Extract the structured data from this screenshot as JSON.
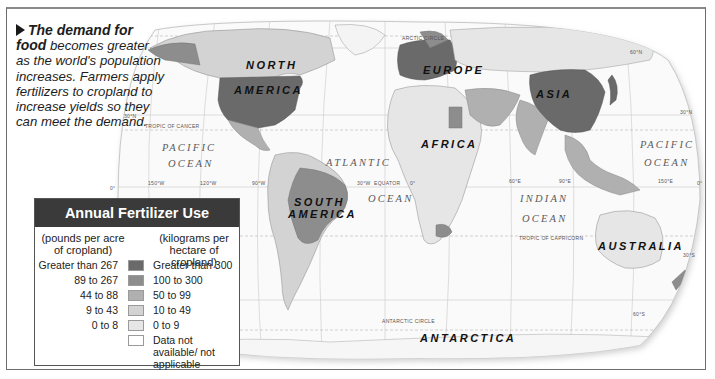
{
  "caption": {
    "lead": "The demand for food",
    "body": "becomes greater as the world's population increases. Farmers apply fertilizers to cropland to increase yields so they can meet the demand."
  },
  "legend": {
    "title": "Annual Fertilizer Use",
    "left_header": "(pounds per acre of cropland)",
    "right_header": "(kilograms per hectare of cropland)",
    "rows": [
      {
        "pounds": "Greater than 267",
        "kilograms": "Greater than 300",
        "color": "#6a6a6a"
      },
      {
        "pounds": "89 to 267",
        "kilograms": "100 to 300",
        "color": "#8d8d8d"
      },
      {
        "pounds": "44 to 88",
        "kilograms": "50 to 99",
        "color": "#b0b0b0"
      },
      {
        "pounds": "9 to 43",
        "kilograms": "10 to 49",
        "color": "#d3d3d3"
      },
      {
        "pounds": "0 to 8",
        "kilograms": "0 to 9",
        "color": "#e6e6e6"
      },
      {
        "pounds": "",
        "kilograms": "Data not available/ not applicable",
        "color": "#ffffff"
      }
    ]
  },
  "map": {
    "continents": {
      "north_america_1": "NORTH",
      "north_america_2": "AMERICA",
      "south_america_1": "SOUTH",
      "south_america_2": "AMERICA",
      "europe": "EUROPE",
      "asia": "ASIA",
      "africa": "AFRICA",
      "australia": "AUSTRALIA",
      "antarctica": "ANTARCTICA"
    },
    "oceans": {
      "pacific_w_1": "PACIFIC",
      "pacific_w_2": "OCEAN",
      "atlantic_1": "ATLANTIC",
      "atlantic_2": "OCEAN",
      "indian_1": "INDIAN",
      "indian_2": "OCEAN",
      "pacific_e_1": "PACIFIC",
      "pacific_e_2": "OCEAN"
    },
    "lines": {
      "arctic_circle": "ARCTIC CIRCLE",
      "tropic_cancer": "TROPIC OF CANCER",
      "equator": "EQUATOR",
      "tropic_capricorn": "TROPIC OF CAPRICORN",
      "antarctic_circle": "ANTARCTIC CIRCLE"
    },
    "coords": {
      "n60": "60°N",
      "n30_w": "30°N",
      "n30_e": "30°N",
      "eq0_w": "0°",
      "eq0_e": "0°",
      "w150": "150°W",
      "w120": "120°W",
      "w90": "90°W",
      "w30": "30°W",
      "zero": "0°",
      "e60": "60°E",
      "e90": "90°E",
      "e150": "150°E",
      "s30": "30°S",
      "s60": "60°S"
    }
  }
}
